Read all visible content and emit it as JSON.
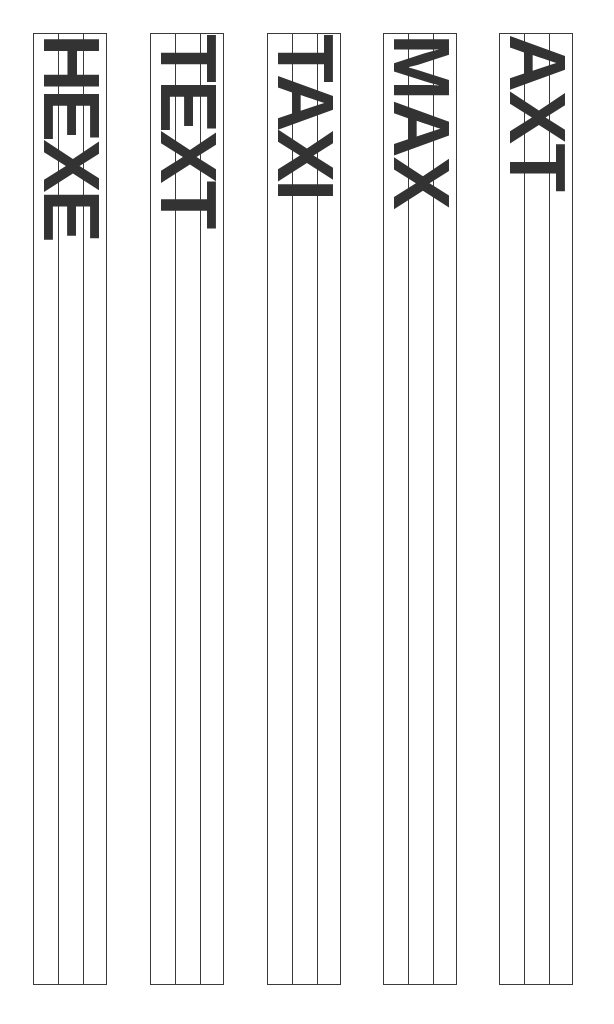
{
  "page": {
    "background_color": "#ffffff",
    "width": 614,
    "height": 1024
  },
  "style": {
    "line_color": "#3a3a3a",
    "text_color": "#333333",
    "rotation_degrees": 90
  },
  "columns": [
    {
      "id": "column-1",
      "label": "HEXE",
      "cell_count": 3,
      "divider_count": 2
    },
    {
      "id": "column-2",
      "label": "TEXT",
      "cell_count": 3,
      "divider_count": 2
    },
    {
      "id": "column-3",
      "label": "TAXI",
      "cell_count": 3,
      "divider_count": 2
    },
    {
      "id": "column-4",
      "label": "MAX",
      "cell_count": 3,
      "divider_count": 2
    },
    {
      "id": "column-5",
      "label": "AXT",
      "cell_count": 3,
      "divider_count": 2
    }
  ]
}
